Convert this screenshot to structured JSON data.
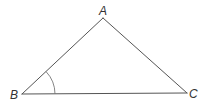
{
  "diagram": {
    "type": "triangle",
    "vertices": {
      "A": {
        "label": "A",
        "x": 103,
        "y": 18
      },
      "B": {
        "label": "B",
        "x": 22,
        "y": 94
      },
      "C": {
        "label": "C",
        "x": 187,
        "y": 93
      }
    },
    "marked_angle": "B",
    "colors": {
      "line": "#555555",
      "label": "#333333",
      "background": "#ffffff"
    }
  }
}
